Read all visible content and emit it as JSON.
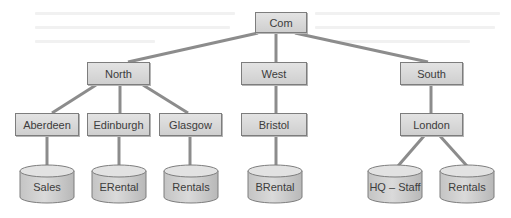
{
  "diagram": {
    "root": {
      "label": "Com"
    },
    "regions": [
      {
        "label": "North"
      },
      {
        "label": "West"
      },
      {
        "label": "South"
      }
    ],
    "sites": [
      {
        "label": "Aberdeen",
        "region": "North"
      },
      {
        "label": "Edinburgh",
        "region": "North"
      },
      {
        "label": "Glasgow",
        "region": "North"
      },
      {
        "label": "Bristol",
        "region": "West"
      },
      {
        "label": "London",
        "region": "South"
      }
    ],
    "databases": [
      {
        "label": "Sales",
        "site": "Aberdeen"
      },
      {
        "label": "ERental",
        "site": "Edinburgh"
      },
      {
        "label": "Rentals",
        "site": "Glasgow"
      },
      {
        "label": "BRental",
        "site": "Bristol"
      },
      {
        "label": "HQ – Staff",
        "site": "London"
      },
      {
        "label": "Rentals",
        "site": "London"
      }
    ],
    "colors": {
      "node_fill_top": "#e3e3e3",
      "node_fill_bottom": "#cfcfcf",
      "node_border": "#7d7d7d",
      "connector": "#8c8c8c",
      "text": "#3c3c3c"
    }
  }
}
